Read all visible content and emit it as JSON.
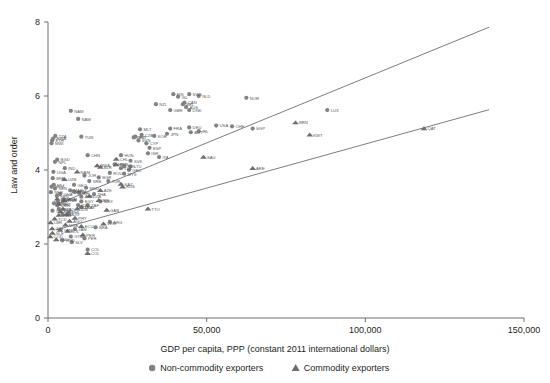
{
  "chart_data": {
    "type": "scatter",
    "title": "",
    "xlabel": "GDP per capita, PPP (constant 2011 international dollars)",
    "ylabel": "Law and order",
    "xlim": [
      0,
      150000
    ],
    "ylim": [
      0,
      8
    ],
    "xticks": [
      0,
      50000,
      100000,
      150000
    ],
    "xticklabels": [
      "0",
      "50,000",
      "100,000",
      "150,000"
    ],
    "yticks": [
      0,
      2,
      4,
      6,
      8
    ],
    "yticklabels": [
      "0",
      "2",
      "4",
      "6",
      "8"
    ],
    "grid": false,
    "legend_position": "below-axis-center",
    "series": [
      {
        "name": "Non-commodity exporters",
        "marker": "circle",
        "color": "#808285",
        "points": [
          {
            "label": "NAM",
            "x": 9500,
            "y": 5.38
          },
          {
            "label": "NAM",
            "x": 7200,
            "y": 5.6
          },
          {
            "label": "TZA",
            "x": 2300,
            "y": 4.92
          },
          {
            "label": "ETH",
            "x": 1300,
            "y": 4.8
          },
          {
            "label": "RWA",
            "x": 1600,
            "y": 4.85
          },
          {
            "label": "TUN",
            "x": 10500,
            "y": 4.9
          },
          {
            "label": "MWI",
            "x": 1100,
            "y": 4.72
          },
          {
            "label": "CHN",
            "x": 12500,
            "y": 4.4
          },
          {
            "label": "BGD",
            "x": 2900,
            "y": 4.28
          },
          {
            "label": "NPL",
            "x": 2200,
            "y": 4.22
          },
          {
            "label": "IND",
            "x": 5300,
            "y": 4.05
          },
          {
            "label": "HUN",
            "x": 23000,
            "y": 4.4
          },
          {
            "label": "SVK",
            "x": 26000,
            "y": 4.25
          },
          {
            "label": "POL",
            "x": 24000,
            "y": 4.1
          },
          {
            "label": "UGA",
            "x": 1700,
            "y": 3.95
          },
          {
            "label": "BFA",
            "x": 1500,
            "y": 3.78
          },
          {
            "label": "MOZ",
            "x": 1100,
            "y": 3.55
          },
          {
            "label": "MLI",
            "x": 1800,
            "y": 3.6
          },
          {
            "label": "NER",
            "x": 900,
            "y": 3.4
          },
          {
            "label": "KEN",
            "x": 2800,
            "y": 3.3
          },
          {
            "label": "SEN",
            "x": 2200,
            "y": 3.5
          },
          {
            "label": "GHA",
            "x": 3800,
            "y": 3.35
          },
          {
            "label": "CIV",
            "x": 3100,
            "y": 3.15
          },
          {
            "label": "CMR",
            "x": 2900,
            "y": 3.05
          },
          {
            "label": "ZMB",
            "x": 3400,
            "y": 2.95
          },
          {
            "label": "BEN",
            "x": 1900,
            "y": 3.1
          },
          {
            "label": "TGO",
            "x": 1400,
            "y": 2.9
          },
          {
            "label": "PAK",
            "x": 4600,
            "y": 2.8
          },
          {
            "label": "LKA",
            "x": 10500,
            "y": 3.0
          },
          {
            "label": "PHL",
            "x": 6500,
            "y": 2.85
          },
          {
            "label": "VNM",
            "x": 5100,
            "y": 3.2
          },
          {
            "label": "IDN",
            "x": 9500,
            "y": 3.05
          },
          {
            "label": "THA",
            "x": 14500,
            "y": 3.35
          },
          {
            "label": "MYS",
            "x": 24000,
            "y": 3.9
          },
          {
            "label": "TUR",
            "x": 19000,
            "y": 3.7
          },
          {
            "label": "MEX",
            "x": 16500,
            "y": 3.15
          },
          {
            "label": "BRA",
            "x": 15000,
            "y": 2.45
          },
          {
            "label": "ARG",
            "x": 19500,
            "y": 2.6
          },
          {
            "label": "COL",
            "x": 12500,
            "y": 1.85
          },
          {
            "label": "PER",
            "x": 11500,
            "y": 2.15
          },
          {
            "label": "JAM",
            "x": 8500,
            "y": 2.4
          },
          {
            "label": "HND",
            "x": 4500,
            "y": 2.1
          },
          {
            "label": "GTM",
            "x": 7200,
            "y": 2.2
          },
          {
            "label": "SLV",
            "x": 7500,
            "y": 2.05
          },
          {
            "label": "MLT",
            "x": 29000,
            "y": 5.1
          },
          {
            "label": "CZE",
            "x": 29500,
            "y": 4.95
          },
          {
            "label": "EST",
            "x": 27500,
            "y": 4.9
          },
          {
            "label": "SVN",
            "x": 28500,
            "y": 4.8
          },
          {
            "label": "PRT",
            "x": 27000,
            "y": 4.88
          },
          {
            "label": "CYP",
            "x": 31000,
            "y": 4.72
          },
          {
            "label": "ESP",
            "x": 32000,
            "y": 4.6
          },
          {
            "label": "ITA",
            "x": 35000,
            "y": 4.35
          },
          {
            "label": "GRC",
            "x": 25500,
            "y": 4.0
          },
          {
            "label": "LTU",
            "x": 26000,
            "y": 4.1
          },
          {
            "label": "LVA",
            "x": 23000,
            "y": 4.05
          },
          {
            "label": "NZL",
            "x": 34000,
            "y": 5.78
          },
          {
            "label": "ISL",
            "x": 41000,
            "y": 5.98
          },
          {
            "label": "FIN",
            "x": 39500,
            "y": 6.05
          },
          {
            "label": "SWE",
            "x": 44500,
            "y": 6.05
          },
          {
            "label": "NLD",
            "x": 47500,
            "y": 6.0
          },
          {
            "label": "NOR",
            "x": 62500,
            "y": 5.95
          },
          {
            "label": "CAN",
            "x": 43000,
            "y": 5.82
          },
          {
            "label": "AUS",
            "x": 43500,
            "y": 5.7
          },
          {
            "label": "GBR",
            "x": 38500,
            "y": 5.62
          },
          {
            "label": "DNK",
            "x": 44500,
            "y": 5.62
          },
          {
            "label": "BEL",
            "x": 42500,
            "y": 5.78
          },
          {
            "label": "DEU",
            "x": 44500,
            "y": 5.15
          },
          {
            "label": "FRA",
            "x": 38500,
            "y": 5.12
          },
          {
            "label": "IRL",
            "x": 47500,
            "y": 5.05
          },
          {
            "label": "AUT",
            "x": 45000,
            "y": 5.02
          },
          {
            "label": "JPN",
            "x": 37500,
            "y": 4.98
          },
          {
            "label": "USA",
            "x": 53000,
            "y": 5.2
          },
          {
            "label": "CHE",
            "x": 58000,
            "y": 5.18
          },
          {
            "label": "SGP",
            "x": 64500,
            "y": 5.12
          },
          {
            "label": "LUX",
            "x": 88000,
            "y": 5.62
          },
          {
            "label": "KOR",
            "x": 33500,
            "y": 4.92
          },
          {
            "label": "ISR",
            "x": 31500,
            "y": 4.45
          },
          {
            "label": "ZAF",
            "x": 12500,
            "y": 3.05
          },
          {
            "label": "EGY",
            "x": 10500,
            "y": 3.15
          },
          {
            "label": "MAR",
            "x": 7000,
            "y": 3.45
          },
          {
            "label": "JOR",
            "x": 11500,
            "y": 3.85
          },
          {
            "label": "UKR",
            "x": 8500,
            "y": 3.4
          },
          {
            "label": "BGR",
            "x": 16000,
            "y": 3.8
          },
          {
            "label": "ROU",
            "x": 19500,
            "y": 3.92
          },
          {
            "label": "HRV",
            "x": 21000,
            "y": 4.15
          },
          {
            "label": "SRB",
            "x": 13000,
            "y": 3.7
          },
          {
            "label": "MKD",
            "x": 12000,
            "y": 3.52
          },
          {
            "label": "ALB",
            "x": 10500,
            "y": 3.28
          },
          {
            "label": "MDA",
            "x": 4800,
            "y": 3.2
          },
          {
            "label": "ARM",
            "x": 8000,
            "y": 3.42
          },
          {
            "label": "GEO",
            "x": 8200,
            "y": 3.6
          },
          {
            "label": "BIH",
            "x": 9800,
            "y": 3.38
          }
        ]
      },
      {
        "name": "Commodity exporters",
        "marker": "triangle",
        "color": "#6d6e71",
        "points": [
          {
            "label": "QAT",
            "x": 118500,
            "y": 5.12
          },
          {
            "label": "BRN",
            "x": 78000,
            "y": 5.28
          },
          {
            "label": "KWT",
            "x": 82500,
            "y": 4.95
          },
          {
            "label": "ARE",
            "x": 64500,
            "y": 4.05
          },
          {
            "label": "TTO",
            "x": 31500,
            "y": 2.95
          },
          {
            "label": "GAB",
            "x": 18500,
            "y": 2.92
          },
          {
            "label": "RUS",
            "x": 23500,
            "y": 3.55
          },
          {
            "label": "RUS",
            "x": 21500,
            "y": 4.15
          },
          {
            "label": "SAU",
            "x": 49000,
            "y": 4.35
          },
          {
            "label": "KAZ",
            "x": 23000,
            "y": 3.62
          },
          {
            "label": "AZE",
            "x": 16500,
            "y": 3.45
          },
          {
            "label": "DZA",
            "x": 13000,
            "y": 3.3
          },
          {
            "label": "IRN",
            "x": 16000,
            "y": 3.18
          },
          {
            "label": "VEN",
            "x": 17500,
            "y": 2.55
          },
          {
            "label": "PRY",
            "x": 8500,
            "y": 2.7
          },
          {
            "label": "BOL",
            "x": 6200,
            "y": 2.35
          },
          {
            "label": "ECU",
            "x": 10500,
            "y": 2.48
          },
          {
            "label": "NGA",
            "x": 5500,
            "y": 2.52
          },
          {
            "label": "AGO",
            "x": 6800,
            "y": 2.62
          },
          {
            "label": "COG",
            "x": 5800,
            "y": 2.8
          },
          {
            "label": "TCD",
            "x": 2100,
            "y": 2.68
          },
          {
            "label": "MNG",
            "x": 10500,
            "y": 3.0
          },
          {
            "label": "CHL",
            "x": 21500,
            "y": 4.3
          },
          {
            "label": "BWA",
            "x": 15500,
            "y": 4.12
          },
          {
            "label": "PER",
            "x": 11000,
            "y": 2.25
          },
          {
            "label": "COL",
            "x": 12500,
            "y": 1.75
          },
          {
            "label": "IDN",
            "x": 9200,
            "y": 2.95
          },
          {
            "label": "ZMB",
            "x": 3400,
            "y": 2.78
          },
          {
            "label": "GIN",
            "x": 1300,
            "y": 2.42
          },
          {
            "label": "SLE",
            "x": 1400,
            "y": 2.3
          },
          {
            "label": "LBR",
            "x": 800,
            "y": 2.58
          },
          {
            "label": "YEM",
            "x": 3800,
            "y": 2.38
          },
          {
            "label": "SDN",
            "x": 3900,
            "y": 2.88
          },
          {
            "label": "COD",
            "x": 700,
            "y": 2.2
          },
          {
            "label": "MRT",
            "x": 3400,
            "y": 3.08
          },
          {
            "label": "NAM",
            "x": 9200,
            "y": 3.95
          },
          {
            "label": "CMR",
            "x": 2900,
            "y": 3.22
          },
          {
            "label": "UZB",
            "x": 5200,
            "y": 3.75
          },
          {
            "label": "BLR",
            "x": 16500,
            "y": 4.08
          },
          {
            "label": "VNM",
            "x": 5000,
            "y": 3.18
          },
          {
            "label": "PNG",
            "x": 2600,
            "y": 2.12
          },
          {
            "label": "LAO",
            "x": 4700,
            "y": 2.95
          }
        ]
      }
    ],
    "trendlines": [
      {
        "name": "upper-trend",
        "x0": 3000,
        "y0": 3.08,
        "x1": 139000,
        "y1": 7.86
      },
      {
        "name": "lower-trend",
        "x0": 2500,
        "y0": 2.38,
        "x1": 139000,
        "y1": 5.63
      }
    ]
  },
  "legend": {
    "items": [
      {
        "label": "Non-commodity exporters",
        "marker": "circle"
      },
      {
        "label": "Commodity exporters",
        "marker": "triangle"
      }
    ]
  },
  "colors": {
    "axis": "#6d6e71",
    "text": "#231f20",
    "marker_circle": "#808285",
    "marker_triangle": "#6d6e71",
    "trend": "#6d6e71",
    "background": "#ffffff"
  }
}
